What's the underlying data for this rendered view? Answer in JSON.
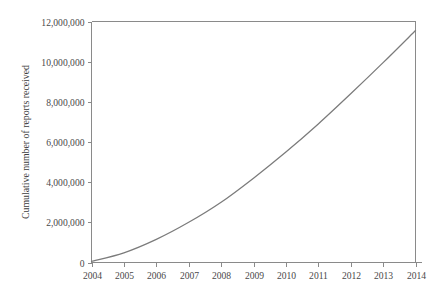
{
  "chart_data": {
    "type": "line",
    "title": "",
    "subtitle": "",
    "xlabel": "",
    "ylabel": "Cumulative number of reports received",
    "x": [
      2004,
      2005,
      2006,
      2007,
      2008,
      2009,
      2010,
      2011,
      2012,
      2013,
      2014
    ],
    "categories": [
      "2004",
      "2005",
      "2006",
      "2007",
      "2008",
      "2009",
      "2010",
      "2011",
      "2012",
      "2013",
      "2014"
    ],
    "series": [
      {
        "name": "Cumulative number of reports received",
        "values": [
          50000,
          480000,
          1150000,
          2000000,
          3000000,
          4200000,
          5500000,
          6900000,
          8400000,
          9950000,
          11550000
        ],
        "color": "#7b7b7b"
      }
    ],
    "xlim": [
      2004,
      2014
    ],
    "ylim": [
      0,
      12000000
    ],
    "xticks": [
      2004,
      2005,
      2006,
      2007,
      2008,
      2009,
      2010,
      2011,
      2012,
      2013,
      2014
    ],
    "xtick_labels": [
      "2004",
      "2005",
      "2006",
      "2007",
      "2008",
      "2009",
      "2010",
      "2011",
      "2012",
      "2013",
      "2014"
    ],
    "yticks": [
      0,
      2000000,
      4000000,
      6000000,
      8000000,
      10000000,
      12000000
    ],
    "ytick_labels": [
      "0",
      "2,000,000",
      "4,000,000",
      "6,000,000",
      "8,000,000",
      "10,000,000",
      "12,000,000"
    ],
    "grid": false,
    "legend": false,
    "legend_position": "none",
    "frame": "box",
    "background_color": "#ffffff",
    "axis_color": "#8a8a8a",
    "text_color": "#3d3d3d",
    "annotations": []
  }
}
